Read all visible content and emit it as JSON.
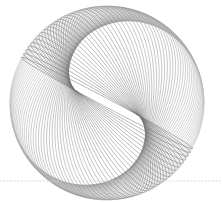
{
  "canvas": {
    "width": 222,
    "height": 202,
    "background_color": "#ffffff",
    "title": "Rotating Ellipse Family Envelope"
  },
  "chart_data": {
    "type": "line",
    "title": "",
    "subtitle": "",
    "xlabel": "",
    "ylabel": "",
    "grid": false,
    "legend": null,
    "axis_visible": false,
    "tick_labels_x": [],
    "tick_labels_y": [],
    "center": {
      "x": 107,
      "y": 103
    },
    "semi_major_axis": 97,
    "semi_minor_axis_start": 95,
    "semi_minor_axis_end": 5,
    "rotation_start_deg": 0,
    "rotation_end_deg": -152,
    "curve_count": 60,
    "stroke_color": "#8c8c8c",
    "stroke_color_dark": "#6e6e6e",
    "stroke_color_light": "#c9c9c9",
    "stroke_width": 0.45,
    "envelope_tilt_deg": -30,
    "series": [
      {
        "name": "ellipse-family",
        "parameter": "theta_rotation_deg",
        "values": [
          0,
          -2.57,
          -5.15,
          -7.72,
          -10.3,
          -12.88,
          -15.45,
          -18.03,
          -20.6,
          -23.18,
          -25.76,
          -28.33,
          -30.91,
          -33.49,
          -36.06,
          -38.64,
          -41.21,
          -43.79,
          -46.37,
          -48.94,
          -51.52,
          -54.1,
          -56.67,
          -59.25,
          -61.82,
          -64.4,
          -66.98,
          -69.55,
          -72.13,
          -74.71,
          -77.28,
          -79.86,
          -82.43,
          -85.01,
          -87.59,
          -90.16,
          -92.74,
          -95.32,
          -97.89,
          -100.47,
          -103.04,
          -105.62,
          -108.2,
          -110.77,
          -113.35,
          -115.93,
          -118.5,
          -121.08,
          -123.65,
          -126.23,
          -128.81,
          -131.38,
          -133.96,
          -136.54,
          -139.11,
          -141.69,
          -144.26,
          -146.84,
          -149.42,
          -152
        ]
      },
      {
        "name": "semi-minor-axis",
        "parameter": "b_pixels",
        "values": [
          95,
          93.5,
          91.9,
          90.4,
          88.8,
          87.3,
          85.8,
          84.2,
          82.7,
          81.1,
          79.6,
          78.1,
          76.5,
          75.0,
          73.4,
          71.9,
          70.4,
          68.8,
          67.3,
          65.7,
          64.2,
          62.7,
          61.1,
          59.6,
          58.0,
          56.5,
          55.0,
          53.4,
          51.9,
          50.3,
          48.8,
          47.3,
          45.7,
          44.2,
          42.6,
          41.1,
          39.6,
          38.0,
          36.5,
          34.9,
          33.4,
          31.9,
          30.3,
          28.8,
          27.2,
          25.7,
          24.2,
          22.6,
          21.1,
          19.5,
          18.0,
          16.5,
          14.9,
          13.4,
          11.8,
          10.3,
          8.8,
          7.2,
          5.7,
          4.1
        ]
      }
    ],
    "baseline": {
      "name": "dotted-baseline",
      "y": 181,
      "x_start": 0,
      "x_end": 222,
      "style": "dotted",
      "color": "#d4d4d4",
      "dot_size": 1,
      "dot_gap": 2.6,
      "stroke_width": 1
    }
  },
  "labels": {
    "figure_caption": "",
    "annotations": []
  }
}
